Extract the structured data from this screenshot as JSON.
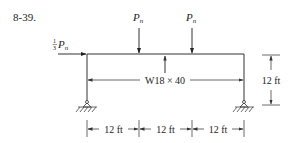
{
  "problem_number": "8-39.",
  "loads": {
    "vertical_1": {
      "symbol": "P",
      "subscript": "n"
    },
    "vertical_2": {
      "symbol": "P",
      "subscript": "n"
    },
    "horizontal": {
      "coefficient_num": "1",
      "coefficient_den": "3",
      "symbol": "P",
      "subscript": "n"
    }
  },
  "member": {
    "section_label": "W18 × 40"
  },
  "dimensions": {
    "height": "12 ft",
    "spans": [
      "12 ft",
      "12 ft",
      "12 ft"
    ]
  }
}
